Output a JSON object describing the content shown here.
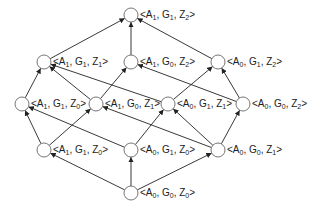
{
  "diagram": {
    "type": "lattice",
    "nodes": [
      {
        "id": "n0",
        "label": {
          "A": "1",
          "G": "1",
          "Z": "2"
        },
        "x": 131,
        "y": 15
      },
      {
        "id": "n1",
        "label": {
          "A": "1",
          "G": "1",
          "Z": "1"
        },
        "x": 44,
        "y": 62
      },
      {
        "id": "n2",
        "label": {
          "A": "1",
          "G": "0",
          "Z": "2"
        },
        "x": 131,
        "y": 62
      },
      {
        "id": "n3",
        "label": {
          "A": "0",
          "G": "1",
          "Z": "2"
        },
        "x": 218,
        "y": 62
      },
      {
        "id": "n4",
        "label": {
          "A": "1",
          "G": "1",
          "Z": "0"
        },
        "x": 22,
        "y": 104
      },
      {
        "id": "n5",
        "label": {
          "A": "1",
          "G": "0",
          "Z": "1"
        },
        "x": 96,
        "y": 104
      },
      {
        "id": "n6",
        "label": {
          "A": "0",
          "G": "1",
          "Z": "1"
        },
        "x": 168,
        "y": 104
      },
      {
        "id": "n7",
        "label": {
          "A": "0",
          "G": "0",
          "Z": "2"
        },
        "x": 243,
        "y": 104
      },
      {
        "id": "n8",
        "label": {
          "A": "1",
          "G": "1",
          "Z": "0"
        },
        "x": 44,
        "y": 150
      },
      {
        "id": "n9",
        "label": {
          "A": "0",
          "G": "1",
          "Z": "0"
        },
        "x": 131,
        "y": 150
      },
      {
        "id": "n10",
        "label": {
          "A": "0",
          "G": "0",
          "Z": "1"
        },
        "x": 218,
        "y": 150
      },
      {
        "id": "n11",
        "label": {
          "A": "0",
          "G": "0",
          "Z": "0"
        },
        "x": 131,
        "y": 193
      }
    ],
    "edges": [
      [
        "n1",
        "n0"
      ],
      [
        "n2",
        "n0"
      ],
      [
        "n3",
        "n0"
      ],
      [
        "n4",
        "n1"
      ],
      [
        "n5",
        "n1"
      ],
      [
        "n5",
        "n2"
      ],
      [
        "n6",
        "n1"
      ],
      [
        "n6",
        "n3"
      ],
      [
        "n7",
        "n2"
      ],
      [
        "n7",
        "n3"
      ],
      [
        "n8",
        "n4"
      ],
      [
        "n8",
        "n5"
      ],
      [
        "n9",
        "n4"
      ],
      [
        "n9",
        "n6"
      ],
      [
        "n10",
        "n5"
      ],
      [
        "n10",
        "n6"
      ],
      [
        "n10",
        "n7"
      ],
      [
        "n11",
        "n8"
      ],
      [
        "n11",
        "n9"
      ],
      [
        "n11",
        "n10"
      ]
    ],
    "style": {
      "edge_color": "#222222",
      "node_fill": "#ffffff",
      "node_stroke": "#666666",
      "node_radius": 7
    }
  }
}
